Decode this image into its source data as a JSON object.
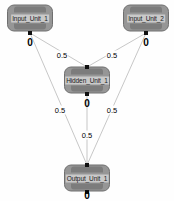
{
  "diagram": {
    "background_color": "#fefefe",
    "node_fill_color": "#969696",
    "node_bar_color": "#7c7c7c",
    "edge_color": "#b9b9b9",
    "port_color": "#101010"
  },
  "units": [
    {
      "id": "input-unit-1",
      "label": "Input_Unit_1",
      "value": "0",
      "x": 30,
      "y": 18,
      "role": "input"
    },
    {
      "id": "input-unit-2",
      "label": "Input_Unit_2",
      "value": "0",
      "x": 146,
      "y": 18,
      "role": "input"
    },
    {
      "id": "hidden-unit-1",
      "label": "Hidden_Unit_1",
      "value": "0",
      "x": 87,
      "y": 80,
      "role": "hidden"
    },
    {
      "id": "output-unit-1",
      "label": "Output_Unit_1",
      "value": "0",
      "x": 87,
      "y": 178,
      "role": "output"
    }
  ],
  "connections": [
    {
      "id": "edge-input1-hidden",
      "from": "input-unit-1",
      "to": "hidden-unit-1",
      "weight": "0.5",
      "label_x": 62,
      "label_y": 55
    },
    {
      "id": "edge-input2-hidden",
      "from": "input-unit-2",
      "to": "hidden-unit-1",
      "weight": "0.5",
      "label_x": 112,
      "label_y": 55
    },
    {
      "id": "edge-input1-output",
      "from": "input-unit-1",
      "to": "output-unit-1",
      "weight": "0.5",
      "label_x": 60,
      "label_y": 110
    },
    {
      "id": "edge-input2-output",
      "from": "input-unit-2",
      "to": "output-unit-1",
      "weight": "0.5",
      "label_x": 112,
      "label_y": 110
    },
    {
      "id": "edge-hidden-output",
      "from": "hidden-unit-1",
      "to": "output-unit-1",
      "weight": "0.5",
      "label_x": 87,
      "label_y": 135
    }
  ]
}
